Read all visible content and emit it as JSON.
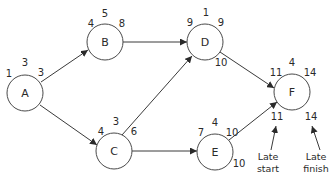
{
  "diagram": {
    "type": "activity-on-node network",
    "colors": {
      "stroke": "#4a4a4a",
      "text": "#2a2a2a",
      "background": "#ffffff"
    },
    "nodes": [
      {
        "id": "A",
        "label": "A",
        "duration": "3",
        "early_start": "1",
        "early_finish": "3",
        "late_start": "",
        "late_finish": ""
      },
      {
        "id": "B",
        "label": "B",
        "duration": "5",
        "early_start": "4",
        "early_finish": "8",
        "late_start": "",
        "late_finish": ""
      },
      {
        "id": "C",
        "label": "C",
        "duration": "3",
        "early_start": "4",
        "early_finish": "6",
        "late_start": "",
        "late_finish": ""
      },
      {
        "id": "D",
        "label": "D",
        "duration": "1",
        "early_start": "9",
        "early_finish": "9",
        "late_start": "",
        "late_finish": "10"
      },
      {
        "id": "E",
        "label": "E",
        "duration": "4",
        "early_start": "7",
        "early_finish": "10",
        "late_start": "",
        "late_finish": "10"
      },
      {
        "id": "F",
        "label": "F",
        "duration": "4",
        "early_start": "11",
        "early_finish": "14",
        "late_start": "11",
        "late_finish": "14"
      }
    ],
    "edges": [
      {
        "from": "A",
        "to": "B"
      },
      {
        "from": "A",
        "to": "C"
      },
      {
        "from": "B",
        "to": "D"
      },
      {
        "from": "C",
        "to": "D"
      },
      {
        "from": "C",
        "to": "E"
      },
      {
        "from": "D",
        "to": "F"
      },
      {
        "from": "E",
        "to": "F"
      }
    ],
    "annotations": {
      "late_start": {
        "line1": "Late",
        "line2": "start"
      },
      "late_finish": {
        "line1": "Late",
        "line2": "finish"
      }
    }
  }
}
